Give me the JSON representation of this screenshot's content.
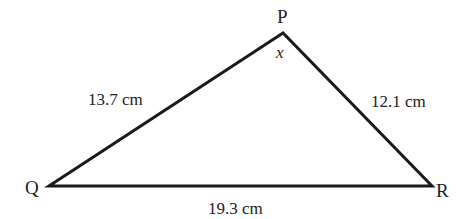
{
  "diagram": {
    "type": "triangle",
    "stroke_color": "#1a1a1a",
    "text_color": "#222222",
    "vertices": {
      "P": {
        "label": "P",
        "x": 283,
        "y": 33
      },
      "Q": {
        "label": "Q",
        "x": 49,
        "y": 186
      },
      "R": {
        "label": "R",
        "x": 432,
        "y": 186
      }
    },
    "sides": {
      "PQ": {
        "label": "13.7 cm"
      },
      "PR": {
        "label": "12.1 cm"
      },
      "QR": {
        "label": "19.3 cm"
      }
    },
    "angle": {
      "vertex": "P",
      "label": "x"
    }
  }
}
